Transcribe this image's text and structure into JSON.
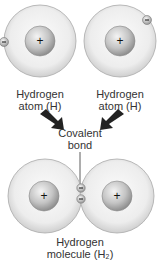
{
  "atoms": [
    {
      "label_line1": "Hydrogen",
      "label_line2": "atom (H)",
      "nucleus": "+",
      "electron": "−"
    },
    {
      "label_line1": "Hydrogen",
      "label_line2": "atom (H)",
      "nucleus": "+",
      "electron": "−"
    }
  ],
  "bond": {
    "label_line1": "Covalent",
    "label_line2": "bond"
  },
  "molecule": {
    "label_line1": "Hydrogen",
    "label_line2": "molecule (H₂)",
    "nuclei": [
      "+",
      "+"
    ],
    "electrons": [
      "−",
      "−"
    ]
  },
  "colors": {
    "shell": "#e8e8e8",
    "shell_edge": "#a0a0a0",
    "nucleus": "#b8b8b8",
    "arrow": "#222222"
  }
}
